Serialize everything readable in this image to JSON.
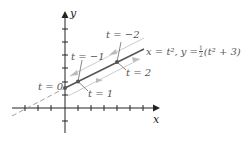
{
  "diagram": {
    "axes": {
      "x_label": "x",
      "y_label": "y"
    },
    "curve_label": "x = t², y = ½(t² + 3)",
    "curve_label_parts": {
      "lhs": "x = t², y = ",
      "frac_num": "1",
      "frac_den": "2",
      "rhs": "(t² + 3)"
    },
    "point_labels": [
      {
        "t": "t = 0"
      },
      {
        "t": "t = −1"
      },
      {
        "t": "t = 1"
      },
      {
        "t": "t = −2"
      },
      {
        "t": "t = 2"
      }
    ],
    "colors": {
      "axis": "#222222",
      "curve": "#555555",
      "arrow_guides": "#bbbbbb",
      "text": "#555555"
    }
  }
}
